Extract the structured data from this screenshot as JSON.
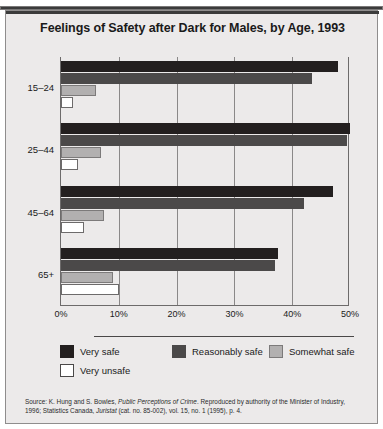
{
  "page": {
    "clipped_header_text": "",
    "title": "Feelings of Safety after Dark for Males, by Age, 1993"
  },
  "source": {
    "prefix": "Source: K. Hung and S. Bowles, ",
    "italic1": "Public Perceptions of Crime",
    "middle": ". Reproduced by authority of the Minister of Industry, 1996; Statistics Canada, ",
    "italic2": "Juristat",
    "suffix": " (cat. no. 85-002), vol. 15, no. 1 (1995), p. 4."
  },
  "colors": {
    "very_safe": "#231f1f",
    "reasonably_safe": "#4b4949",
    "somewhat_safe": "#b2b0b0",
    "very_unsafe": "#ffffff",
    "panel_background": "#eceaea",
    "axis": "#6d6b6b",
    "gridline": "#8a8888"
  },
  "chart_data": {
    "type": "bar",
    "orientation": "horizontal",
    "title": "Feelings of Safety after Dark for Males, by Age, 1993",
    "xlabel": "",
    "ylabel": "",
    "categories": [
      "15–24",
      "25–44",
      "45–64",
      "65+"
    ],
    "series": [
      {
        "name": "Very safe",
        "color": "#231f1f",
        "values": [
          48,
          50,
          47,
          37.5
        ]
      },
      {
        "name": "Reasonably safe",
        "color": "#4b4949",
        "values": [
          43.5,
          49.5,
          42,
          37
        ]
      },
      {
        "name": "Somewhat safe",
        "color": "#b2b0b0",
        "values": [
          6,
          7,
          7.5,
          9
        ]
      },
      {
        "name": "Very unsafe",
        "color": "#ffffff",
        "values": [
          2,
          3,
          4,
          10
        ]
      }
    ],
    "xlim": [
      0,
      50
    ],
    "xticks": [
      0,
      10,
      20,
      30,
      40,
      50
    ],
    "xtick_labels": [
      "0%",
      "10%",
      "20%",
      "30%",
      "40%",
      "50%"
    ],
    "grid": true,
    "grid_axis": "x",
    "legend_position": "bottom",
    "value_unit": "%"
  }
}
